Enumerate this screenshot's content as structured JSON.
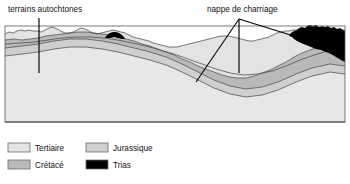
{
  "figure": {
    "type": "geological-cross-section",
    "title": "",
    "background_color": "#ffffff"
  },
  "annotations": [
    {
      "id": "terrains-autochtones",
      "label": "terrains autochtones",
      "text_x": 8,
      "text_y": 12,
      "pointer": {
        "kind": "vertical-line",
        "x": 39,
        "y1": 18,
        "y2": 73
      }
    },
    {
      "id": "nappe-de-charriage",
      "label": "nappe de charriage",
      "text_x": 207,
      "text_y": 12,
      "pointer": {
        "kind": "three-leaders",
        "apex_x": 239,
        "apex_y": 19,
        "leaders": [
          {
            "to_x": 196,
            "to_y": 82
          },
          {
            "to_x": 239,
            "to_y": 73
          },
          {
            "to_x": 297,
            "to_y": 37
          }
        ]
      }
    }
  ],
  "units": [
    {
      "key": "tertiaire",
      "label": "Tertiaire",
      "color": "#e3e3e3",
      "legend_column": 0,
      "legend_row": 0
    },
    {
      "key": "cretace",
      "label": "Crétacé",
      "color": "#b9b9b9",
      "legend_column": 0,
      "legend_row": 1
    },
    {
      "key": "jurassique",
      "label": "Jurassique",
      "color": "#cfcfcf",
      "legend_column": 1,
      "legend_row": 0
    },
    {
      "key": "trias",
      "label": "Trias",
      "color": "#000000",
      "legend_column": 1,
      "legend_row": 1
    }
  ],
  "legend": {
    "swatch_width": 22,
    "swatch_height": 9,
    "col_x": [
      8,
      86
    ],
    "row_y": [
      143,
      160
    ],
    "label_offset_x": 27
  },
  "section": {
    "left": 5,
    "right": 345,
    "top": 26,
    "bottom": 122,
    "contact_line_color": "#4a4a4a",
    "frame_color": "#5a5a5a"
  },
  "colors": {
    "tertiaire": "#e3e3e3",
    "cretace": "#b9b9b9",
    "jurassique": "#cfcfcf",
    "trias": "#000000",
    "line": "#4a4a4a",
    "annotation": "#000000",
    "background": "#ffffff"
  }
}
